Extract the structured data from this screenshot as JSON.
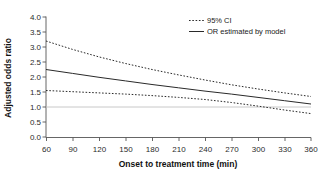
{
  "chart_data": {
    "type": "line",
    "title": "",
    "xlabel": "Onset to treatment time (min)",
    "ylabel": "Adjusted odds ratio",
    "xlim": [
      60,
      360
    ],
    "ylim": [
      0.0,
      4.0
    ],
    "xticks": [
      60,
      90,
      120,
      150,
      180,
      210,
      240,
      270,
      300,
      330,
      360
    ],
    "yticks": [
      "0.0",
      "0.5",
      "1.0",
      "1.5",
      "2.0",
      "2.5",
      "3.0",
      "3.5",
      "4.0"
    ],
    "grid": false,
    "reference_line": {
      "axis": "y",
      "value": 1.0,
      "style": "solid",
      "color": "#b8b8b8"
    },
    "legend": {
      "position": "top-right",
      "entries": [
        {
          "label": "95% CI",
          "style": "dotted"
        },
        {
          "label": "OR estimated by model",
          "style": "solid"
        }
      ]
    },
    "x": [
      60,
      90,
      120,
      150,
      180,
      210,
      240,
      270,
      300,
      330,
      360
    ],
    "series": [
      {
        "name": "95% CI upper",
        "style": "dotted",
        "values": [
          3.2,
          2.92,
          2.67,
          2.45,
          2.25,
          2.07,
          1.9,
          1.74,
          1.6,
          1.47,
          1.35
        ]
      },
      {
        "name": "OR estimated by model",
        "style": "solid",
        "values": [
          2.25,
          2.12,
          1.99,
          1.87,
          1.75,
          1.64,
          1.53,
          1.43,
          1.32,
          1.21,
          1.1
        ]
      },
      {
        "name": "95% CI lower",
        "style": "dotted",
        "values": [
          1.55,
          1.51,
          1.47,
          1.43,
          1.38,
          1.32,
          1.25,
          1.15,
          1.03,
          0.9,
          0.78
        ]
      }
    ]
  },
  "axes": {
    "y_title": "Adjusted odds ratio",
    "x_title": "Onset to treatment time (min)",
    "y_tick_labels": [
      "4.0",
      "3.5",
      "3.0",
      "2.5",
      "2.0",
      "1.5",
      "1.0",
      "0.5",
      "0.0"
    ],
    "x_tick_labels": [
      "60",
      "90",
      "120",
      "150",
      "180",
      "210",
      "240",
      "270",
      "300",
      "330",
      "360"
    ]
  },
  "legend": {
    "ci_label": "95% CI",
    "or_label": "OR estimated by model"
  },
  "caption": {
    "partial_text": ""
  },
  "colors": {
    "line": "#2a2a2a",
    "axis": "#4a4a4a",
    "reference": "#bdbdbd",
    "background": "#ffffff"
  }
}
